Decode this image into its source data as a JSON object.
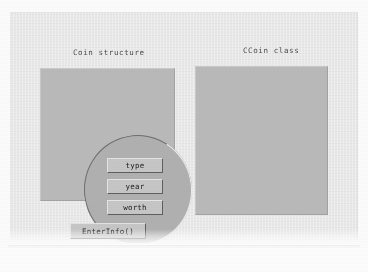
{
  "diagram": {
    "panels": [
      {
        "id": "coin-structure",
        "title": "Coin structure",
        "members": [
          {
            "label": "type"
          },
          {
            "label": "year"
          },
          {
            "label": "worth"
          }
        ]
      },
      {
        "id": "ccoin-class",
        "title": "CCoin class",
        "members": [
          {
            "label": "type"
          },
          {
            "label": "year"
          },
          {
            "label": "worth"
          }
        ],
        "methods": [
          {
            "label": "EnterInfo()"
          }
        ]
      }
    ],
    "standalone": {
      "label": "EnterInfo()"
    },
    "colors": {
      "canvas": "#e9e9e9",
      "panel_fill": "#b9b9b9",
      "circle_fill": "#b0b0b0",
      "box_fill": "#c6c6c6",
      "bevel_light": "#e4e4e4",
      "bevel_dark": "#5f5f5f",
      "text": "#1b1b1b",
      "title_text": "#4a4a4a"
    }
  }
}
